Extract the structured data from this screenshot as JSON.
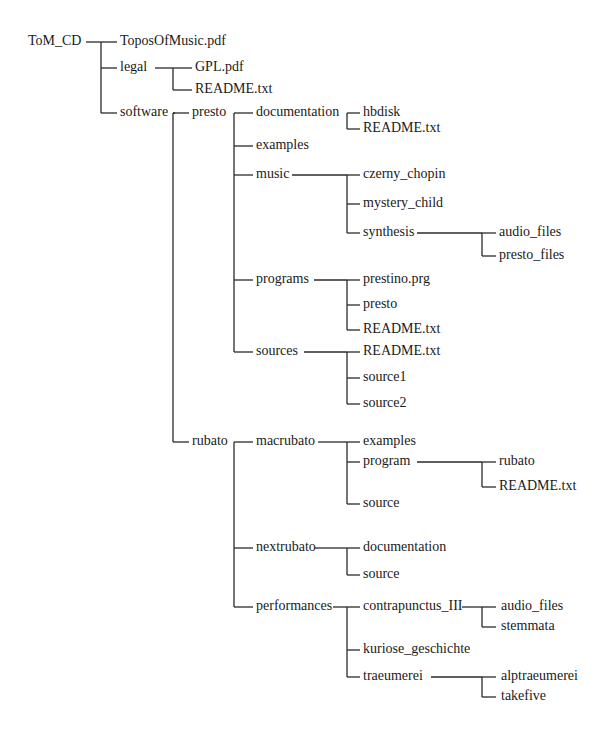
{
  "diagram": {
    "type": "directory-tree",
    "line_color": "#2a2a2a",
    "nodes": [
      {
        "id": "n0",
        "label": "ToM_CD",
        "x": 28,
        "y": 42
      },
      {
        "id": "n1",
        "label": "ToposOfMusic.pdf",
        "x": 120,
        "y": 42
      },
      {
        "id": "n2",
        "label": "legal",
        "x": 120,
        "y": 68
      },
      {
        "id": "n3",
        "label": "GPL.pdf",
        "x": 195,
        "y": 68
      },
      {
        "id": "n4",
        "label": "README.txt",
        "x": 195,
        "y": 90
      },
      {
        "id": "n5",
        "label": "software",
        "x": 120,
        "y": 113
      },
      {
        "id": "n6",
        "label": "presto",
        "x": 192,
        "y": 113
      },
      {
        "id": "n7",
        "label": "documentation",
        "x": 256,
        "y": 113
      },
      {
        "id": "n8",
        "label": "hbdisk",
        "x": 363,
        "y": 113
      },
      {
        "id": "n9",
        "label": "README.txt",
        "x": 363,
        "y": 129
      },
      {
        "id": "n10",
        "label": "examples",
        "x": 256,
        "y": 146
      },
      {
        "id": "n11",
        "label": "music",
        "x": 256,
        "y": 175
      },
      {
        "id": "n12",
        "label": "czerny_chopin",
        "x": 363,
        "y": 175
      },
      {
        "id": "n13",
        "label": "mystery_child",
        "x": 363,
        "y": 204
      },
      {
        "id": "n14",
        "label": "synthesis",
        "x": 363,
        "y": 233
      },
      {
        "id": "n15",
        "label": "audio_files",
        "x": 499,
        "y": 233
      },
      {
        "id": "n16",
        "label": "presto_files",
        "x": 499,
        "y": 256
      },
      {
        "id": "n17",
        "label": "programs",
        "x": 256,
        "y": 280
      },
      {
        "id": "n18",
        "label": "prestino.prg",
        "x": 363,
        "y": 280
      },
      {
        "id": "n19",
        "label": "presto",
        "x": 363,
        "y": 305
      },
      {
        "id": "n20",
        "label": "README.txt",
        "x": 363,
        "y": 330
      },
      {
        "id": "n21",
        "label": "sources",
        "x": 256,
        "y": 352
      },
      {
        "id": "n22",
        "label": "README.txt",
        "x": 363,
        "y": 352
      },
      {
        "id": "n23",
        "label": "source1",
        "x": 363,
        "y": 378
      },
      {
        "id": "n24",
        "label": "source2",
        "x": 363,
        "y": 404
      },
      {
        "id": "n25",
        "label": "rubato",
        "x": 192,
        "y": 442
      },
      {
        "id": "n26",
        "label": "macrubato",
        "x": 256,
        "y": 442
      },
      {
        "id": "n27",
        "label": "examples",
        "x": 363,
        "y": 442
      },
      {
        "id": "n28",
        "label": "program",
        "x": 363,
        "y": 462
      },
      {
        "id": "n29",
        "label": "rubato",
        "x": 499,
        "y": 462
      },
      {
        "id": "n30",
        "label": "README.txt",
        "x": 499,
        "y": 487
      },
      {
        "id": "n31",
        "label": "source",
        "x": 363,
        "y": 504
      },
      {
        "id": "n32",
        "label": "nextrubato",
        "x": 256,
        "y": 548
      },
      {
        "id": "n33",
        "label": "documentation",
        "x": 363,
        "y": 548
      },
      {
        "id": "n34",
        "label": "source",
        "x": 363,
        "y": 575
      },
      {
        "id": "n35",
        "label": "performances",
        "x": 256,
        "y": 607
      },
      {
        "id": "n36",
        "label": "contrapunctus_III",
        "x": 363,
        "y": 607
      },
      {
        "id": "n37",
        "label": "audio_files",
        "x": 501,
        "y": 607
      },
      {
        "id": "n38",
        "label": "stemmata",
        "x": 501,
        "y": 627
      },
      {
        "id": "n39",
        "label": "kuriose_geschichte",
        "x": 363,
        "y": 650
      },
      {
        "id": "n40",
        "label": "traeumerei",
        "x": 363,
        "y": 677
      },
      {
        "id": "n41",
        "label": "alptraeumerei",
        "x": 501,
        "y": 677
      },
      {
        "id": "n42",
        "label": "takefive",
        "x": 501,
        "y": 697
      }
    ],
    "connectors": [
      {
        "from": "n0",
        "vx": 101,
        "hfrom": 86,
        "children_y": [
          42,
          68,
          113
        ],
        "child_x": 117
      },
      {
        "from": "n2",
        "vx": 173,
        "hfrom": 155,
        "children_y": [
          68,
          90
        ],
        "child_x": 192
      },
      {
        "from": "n5",
        "vx": 173,
        "hfrom": 175,
        "children_y": [
          113,
          442
        ],
        "child_x": 189
      },
      {
        "from": "n6",
        "vx": 234,
        "hfrom": 234,
        "children_y": [
          113,
          146,
          175,
          280,
          352
        ],
        "child_x": 253
      },
      {
        "from": "n7",
        "vx": 347,
        "hfrom": 347,
        "children_y": [
          113,
          129
        ],
        "child_x": 360
      },
      {
        "from": "n11",
        "vx": 347,
        "hfrom": 292,
        "children_y": [
          175,
          204,
          233
        ],
        "child_x": 360
      },
      {
        "from": "n14",
        "vx": 482,
        "hfrom": 417,
        "children_y": [
          233,
          256
        ],
        "child_x": 496
      },
      {
        "from": "n17",
        "vx": 347,
        "hfrom": 314,
        "children_y": [
          280,
          305,
          330
        ],
        "child_x": 360
      },
      {
        "from": "n21",
        "vx": 347,
        "hfrom": 304,
        "children_y": [
          352,
          378,
          404
        ],
        "child_x": 360
      },
      {
        "from": "n25",
        "vx": 234,
        "hfrom": 234,
        "children_y": [
          442,
          548,
          607
        ],
        "child_x": 253
      },
      {
        "from": "n26",
        "vx": 347,
        "hfrom": 318,
        "children_y": [
          442,
          462,
          504
        ],
        "child_x": 360
      },
      {
        "from": "n28",
        "vx": 482,
        "hfrom": 417,
        "children_y": [
          462,
          487
        ],
        "child_x": 496
      },
      {
        "from": "n32",
        "vx": 347,
        "hfrom": 315,
        "children_y": [
          548,
          575
        ],
        "child_x": 360
      },
      {
        "from": "n35",
        "vx": 347,
        "hfrom": 333,
        "children_y": [
          607,
          650,
          677
        ],
        "child_x": 360
      },
      {
        "from": "n36",
        "vx": 482,
        "hfrom": 462,
        "children_y": [
          607,
          627
        ],
        "child_x": 496
      },
      {
        "from": "n40",
        "vx": 482,
        "hfrom": 431,
        "children_y": [
          677,
          697
        ],
        "child_x": 496
      }
    ]
  }
}
